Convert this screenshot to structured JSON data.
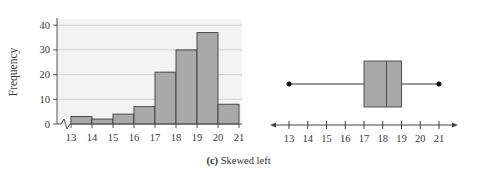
{
  "chart_data": [
    {
      "type": "bar",
      "subtype": "histogram",
      "title": "",
      "xlabel": "",
      "ylabel": "Frequency",
      "bins": [
        [
          13,
          14
        ],
        [
          14,
          15
        ],
        [
          15,
          16
        ],
        [
          16,
          17
        ],
        [
          17,
          18
        ],
        [
          18,
          19
        ],
        [
          19,
          20
        ],
        [
          20,
          21
        ]
      ],
      "categories": [
        "13-14",
        "14-15",
        "15-16",
        "16-17",
        "17-18",
        "18-19",
        "19-20",
        "20-21"
      ],
      "values": [
        3,
        2,
        4,
        7,
        21,
        30,
        37,
        8
      ],
      "x_ticks": [
        13,
        14,
        15,
        16,
        17,
        18,
        19,
        20,
        21
      ],
      "y_ticks": [
        0,
        10,
        20,
        30,
        40
      ],
      "ylim": [
        0,
        42
      ],
      "xlim": [
        13,
        21
      ],
      "grid": "horizontal",
      "axis_break": true,
      "bar_color": "#a9a9a9",
      "grid_bg": "#f2f2f2"
    },
    {
      "type": "box",
      "title": "",
      "min": 13,
      "q1": 17,
      "median": 18.2,
      "q3": 19,
      "max": 21,
      "x_ticks": [
        13,
        14,
        15,
        16,
        17,
        18,
        19,
        20,
        21
      ],
      "xlim": [
        12.5,
        21.5
      ],
      "box_color": "#a9a9a9"
    }
  ],
  "caption": {
    "label": "(c)",
    "text": "Skewed left"
  },
  "histogram": {
    "ylabel": "Frequency",
    "y_tick_labels": [
      "0",
      "10",
      "20",
      "30",
      "40"
    ],
    "x_tick_labels": [
      "13",
      "14",
      "15",
      "16",
      "17",
      "18",
      "19",
      "20",
      "21"
    ]
  },
  "boxplot": {
    "x_tick_labels": [
      "13",
      "14",
      "15",
      "16",
      "17",
      "18",
      "19",
      "20",
      "21"
    ]
  }
}
